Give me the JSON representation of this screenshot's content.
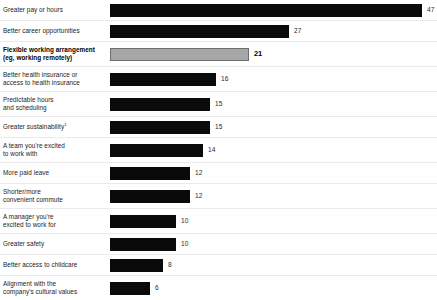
{
  "chart_data": {
    "type": "bar",
    "title": "",
    "subtitle": "",
    "xlabel": "",
    "ylabel": "",
    "orientation": "horizontal",
    "grid": false,
    "legend": "none",
    "xlim": [
      0,
      47
    ],
    "value_suffix": "",
    "categories": [
      "Greater pay or hours",
      "Better career opportunities",
      "Flexible working arrangement (eg, working remotely)",
      "Better health insurance or access to health insurance",
      "Predictable hours and scheduling",
      "Greater sustainability",
      "A team you're excited to work with",
      "More paid leave",
      "Shorter/more convenient commute",
      "A manager you're excited to work for",
      "Greater safety",
      "Better access to childcare",
      "Alignment with the company's cultural values"
    ],
    "values": [
      47,
      27,
      21,
      16,
      15,
      15,
      14,
      12,
      12,
      10,
      10,
      8,
      6
    ],
    "highlight_index": 2,
    "colors": {
      "bar": "#0a0a0a",
      "highlight_bar": "#a6a6a6",
      "highlight_border": "#6e6e6e",
      "rule": "#ebebeb",
      "text": "#232323",
      "background": "#ffffff"
    }
  },
  "rows": [
    {
      "label": "Greater pay or hours",
      "label_line1": "Greater pay or hours",
      "label_line2": "",
      "value": 47,
      "value_text": "47",
      "footnote_marker": "",
      "highlight": false
    },
    {
      "label": "Better career opportunities",
      "label_line1": "Better career opportunities",
      "label_line2": "",
      "value": 27,
      "value_text": "27",
      "footnote_marker": "",
      "highlight": false
    },
    {
      "label": "Flexible working arrangement (eg, working remotely)",
      "label_line1": "Flexible working arrangement",
      "label_line2": "(eg, working remotely)",
      "value": 21,
      "value_text": "21",
      "footnote_marker": "",
      "highlight": true
    },
    {
      "label": "Better health insurance or access to health insurance",
      "label_line1": "Better health insurance or",
      "label_line2": "access to health insurance",
      "value": 16,
      "value_text": "16",
      "footnote_marker": "",
      "highlight": false
    },
    {
      "label": "Predictable hours and scheduling",
      "label_line1": "Predictable hours",
      "label_line2": "and scheduling",
      "value": 15,
      "value_text": "15",
      "footnote_marker": "",
      "highlight": false
    },
    {
      "label": "Greater sustainability",
      "label_line1": "Greater sustainability",
      "label_line2": "",
      "value": 15,
      "value_text": "15",
      "footnote_marker": "1",
      "highlight": false
    },
    {
      "label": "A team you're excited to work with",
      "label_line1": "A team you're excited",
      "label_line2": "to work with",
      "value": 14,
      "value_text": "14",
      "footnote_marker": "",
      "highlight": false
    },
    {
      "label": "More paid leave",
      "label_line1": "More paid leave",
      "label_line2": "",
      "value": 12,
      "value_text": "12",
      "footnote_marker": "",
      "highlight": false
    },
    {
      "label": "Shorter/more convenient commute",
      "label_line1": "Shorter/more",
      "label_line2": "convenient commute",
      "value": 12,
      "value_text": "12",
      "footnote_marker": "",
      "highlight": false
    },
    {
      "label": "A manager you're excited to work for",
      "label_line1": "A manager you're",
      "label_line2": "excited to work for",
      "value": 10,
      "value_text": "10",
      "footnote_marker": "",
      "highlight": false
    },
    {
      "label": "Greater safety",
      "label_line1": "Greater safety",
      "label_line2": "",
      "value": 10,
      "value_text": "10",
      "footnote_marker": "",
      "highlight": false
    },
    {
      "label": "Better access to childcare",
      "label_line1": "Better access to childcare",
      "label_line2": "",
      "value": 8,
      "value_text": "8",
      "footnote_marker": "",
      "highlight": false
    },
    {
      "label": "Alignment with the company's cultural values",
      "label_line1": "Alignment with the",
      "label_line2": "company's cultural values",
      "value": 6,
      "value_text": "6",
      "footnote_marker": "",
      "highlight": false
    }
  ],
  "footnote": {
    "text": ""
  }
}
